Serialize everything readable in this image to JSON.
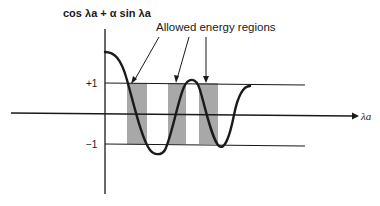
{
  "diagram": {
    "y_axis_label": "cos λa + α sin λa",
    "x_axis_label": "λa",
    "annotation": "Allowed energy regions",
    "tick_plus_one": "+1",
    "tick_minus_one": "−1",
    "colors": {
      "line": "#1a1a1a",
      "band": "#a8a8a8",
      "background": "#ffffff"
    },
    "allowed_bands": [
      {
        "x_start": 127,
        "x_end": 147
      },
      {
        "x_start": 168,
        "x_end": 186
      },
      {
        "x_start": 199,
        "x_end": 218
      }
    ]
  }
}
